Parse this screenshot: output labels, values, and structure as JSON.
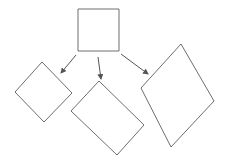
{
  "diagram": {
    "width": 225,
    "height": 167,
    "stroke_color": "#6e6e6e",
    "arrow_color": "#555555",
    "nodes": [
      {
        "id": "parent-square",
        "shape": "square",
        "points": "78,9 119,9 119,51 78,51"
      },
      {
        "id": "child-left-diamond",
        "shape": "rotated-square",
        "points": "42,62 72,93 44,122 15,92"
      },
      {
        "id": "child-middle-rectangle",
        "shape": "rotated-rectangle",
        "points": "99,81 144,125 117,155 71,111"
      },
      {
        "id": "child-right-rhombus",
        "shape": "rotated-rectangle",
        "points": "181,44 214,101 171,147 141,88"
      }
    ],
    "edges": [
      {
        "from": "parent-square",
        "to": "child-left-diamond",
        "x1": 76,
        "y1": 55,
        "x2": 61,
        "y2": 73
      },
      {
        "from": "parent-square",
        "to": "child-middle-rectangle",
        "x1": 98,
        "y1": 57,
        "x2": 101,
        "y2": 79
      },
      {
        "from": "parent-square",
        "to": "child-right-rhombus",
        "x1": 121,
        "y1": 54,
        "x2": 148,
        "y2": 74
      }
    ]
  }
}
